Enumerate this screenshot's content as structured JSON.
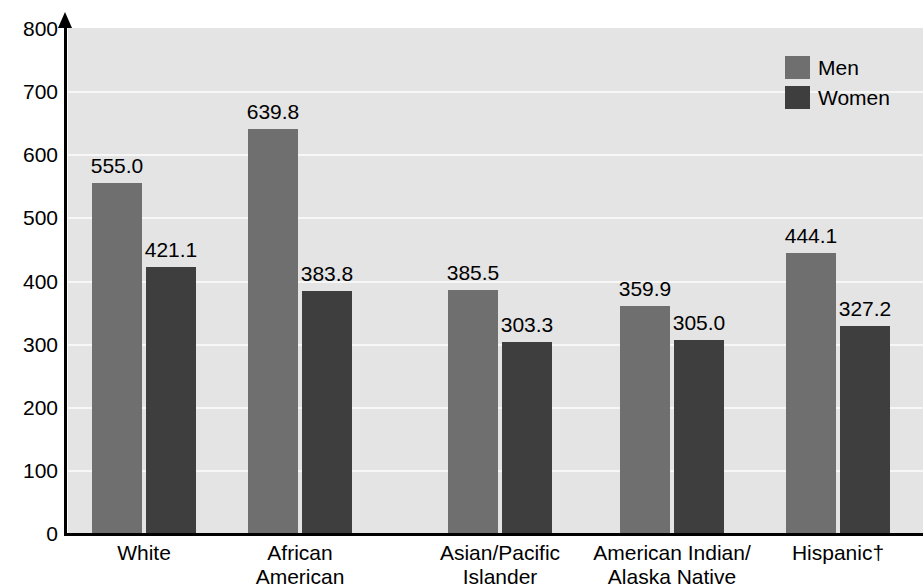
{
  "chart_data": {
    "type": "bar",
    "title": "",
    "xlabel": "",
    "ylabel": "",
    "ylim": [
      0,
      800
    ],
    "ytick_values": [
      800,
      700,
      600,
      500,
      400,
      300,
      200,
      100,
      0
    ],
    "ytick_labels": [
      "800",
      "700",
      "600",
      "500",
      "400",
      "300",
      "200",
      "100",
      "0"
    ],
    "grid": true,
    "legend_position": "top-right",
    "categories": [
      "White",
      "African\nAmerican",
      "Asian/Pacific\nIslander",
      "American Indian/\nAlaska Native",
      "Hispanic†"
    ],
    "series": [
      {
        "name": "Men",
        "color": "#6f6f6f",
        "values": [
          555.0,
          639.8,
          385.5,
          359.9,
          444.1
        ],
        "value_labels": [
          "555.0",
          "639.8",
          "385.5",
          "359.9",
          "444.1"
        ]
      },
      {
        "name": "Women",
        "color": "#3e3e3e",
        "values": [
          421.1,
          383.8,
          303.3,
          305.0,
          327.2
        ],
        "value_labels": [
          "421.1",
          "383.8",
          "303.3",
          "305.0",
          "327.2"
        ]
      }
    ]
  },
  "legend": {
    "items": [
      {
        "label": "Men",
        "color": "#6f6f6f"
      },
      {
        "label": "Women",
        "color": "#3e3e3e"
      }
    ]
  },
  "colors": {
    "plot_background": "#e4e4e4",
    "gridline": "#f7f7f7",
    "axis": "#000000",
    "men_bar": "#6f6f6f",
    "women_bar": "#3e3e3e"
  }
}
